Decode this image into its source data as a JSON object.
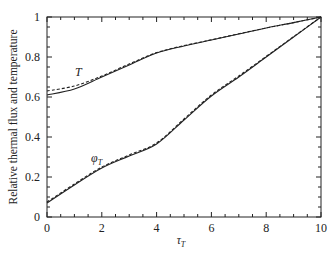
{
  "chart_data": {
    "type": "line",
    "title": "",
    "xlabel": "τ_T",
    "ylabel": "Relative thermal flux and temperature",
    "xlim": [
      0,
      10
    ],
    "ylim": [
      0,
      1
    ],
    "x_ticks": [
      "0",
      "2",
      "4",
      "6",
      "8",
      "10"
    ],
    "y_ticks": [
      "0",
      "0.2",
      "0.4",
      "0.6",
      "0.8",
      "1"
    ],
    "grid": false,
    "legend": "none (inline curve labels)",
    "annotations": [
      {
        "text": "T",
        "x": 1.1,
        "y": 0.73
      },
      {
        "text": "φ_T",
        "x": 1.8,
        "y": 0.3
      }
    ],
    "x": [
      0,
      1,
      2,
      3,
      4,
      5,
      6,
      7,
      8,
      9,
      10
    ],
    "series": [
      {
        "name": "T (solid)",
        "style": "solid",
        "values": [
          0.61,
          0.64,
          0.7,
          0.76,
          0.82,
          0.855,
          0.885,
          0.915,
          0.945,
          0.972,
          1.0
        ]
      },
      {
        "name": "T (dashed)",
        "style": "dashed",
        "values": [
          0.63,
          0.655,
          0.705,
          0.765,
          0.822,
          0.857,
          0.886,
          0.916,
          0.945,
          0.972,
          1.0
        ]
      },
      {
        "name": "φ_T (solid)",
        "style": "solid",
        "values": [
          0.07,
          0.16,
          0.245,
          0.305,
          0.365,
          0.485,
          0.605,
          0.7,
          0.8,
          0.9,
          1.0
        ]
      },
      {
        "name": "φ_T (dashed)",
        "style": "dashed",
        "values": [
          0.075,
          0.165,
          0.25,
          0.31,
          0.37,
          0.49,
          0.61,
          0.705,
          0.803,
          0.902,
          1.0
        ]
      }
    ]
  },
  "labels": {
    "ylabel": "Relative thermal flux and temperature",
    "xlabel_main": "τ",
    "xlabel_sub": "T",
    "curve_T": "T",
    "curve_phi_main": "φ",
    "curve_phi_sub": "T"
  }
}
